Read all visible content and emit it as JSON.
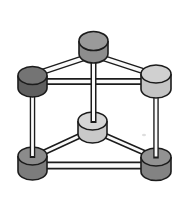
{
  "figure": {
    "canvas": {
      "width": 188,
      "height": 200,
      "background": "#ffffff"
    },
    "style": {
      "outline_color": "#1c1c1c",
      "outline_width": 1.6,
      "bar_fill": "#fafafa"
    },
    "nodes": [
      {
        "id": "top-center-cylinder",
        "cx": 93.5,
        "rx": 14.5,
        "ry": 9.5,
        "top_cy": 41,
        "bottom_cy": 53.5,
        "top_color": "#9a9a9a",
        "body_color": "#8d8d8d"
      },
      {
        "id": "top-left-cylinder",
        "cx": 32.5,
        "rx": 14.5,
        "ry": 9,
        "top_cy": 75.5,
        "bottom_cy": 88,
        "top_color": "#747474",
        "body_color": "#5f5f5f"
      },
      {
        "id": "top-right-cylinder",
        "cx": 156,
        "rx": 15,
        "ry": 9,
        "top_cy": 74,
        "bottom_cy": 89,
        "top_color": "#d0d0d0",
        "body_color": "#c4c4c4"
      },
      {
        "id": "middle-cylinder",
        "cx": 92.5,
        "rx": 14.5,
        "ry": 9,
        "top_cy": 121,
        "bottom_cy": 134,
        "top_color": "#d6d6d6",
        "body_color": "#c9c9c9"
      },
      {
        "id": "bottom-left-cylinder",
        "cx": 32.5,
        "rx": 14.5,
        "ry": 9,
        "top_cy": 156,
        "bottom_cy": 171,
        "top_color": "#8b8b8b",
        "body_color": "#7c7c7c"
      },
      {
        "id": "bottom-right-cylinder",
        "cx": 156,
        "rx": 15,
        "ry": 9,
        "top_cy": 157,
        "bottom_cy": 171.5,
        "top_color": "#929292",
        "body_color": "#838383"
      }
    ],
    "bars": [
      {
        "id": "bar-top-center-to-top-left",
        "x1": 90,
        "y1": 56,
        "x2": 36,
        "y2": 74,
        "outer": 6.5,
        "inner": 3.5
      },
      {
        "id": "bar-top-center-to-top-right",
        "x1": 97,
        "y1": 56,
        "x2": 152,
        "y2": 74,
        "outer": 6.5,
        "inner": 3.5
      },
      {
        "id": "bar-top-left-to-top-right",
        "x1": 34,
        "y1": 81.5,
        "x2": 155,
        "y2": 81.5,
        "outer": 7,
        "inner": 3.5
      },
      {
        "id": "bar-middle-to-bottom-left",
        "x1": 88,
        "y1": 132,
        "x2": 34,
        "y2": 157,
        "outer": 6,
        "inner": 3
      },
      {
        "id": "bar-middle-to-bottom-right",
        "x1": 97,
        "y1": 132,
        "x2": 154,
        "y2": 157,
        "outer": 6,
        "inner": 3
      },
      {
        "id": "bar-bottom-left-to-bottom-right",
        "x1": 34,
        "y1": 165.5,
        "x2": 155,
        "y2": 165.5,
        "outer": 8,
        "inner": 4.5
      },
      {
        "id": "bar-top-center-to-middle",
        "x1": 93.5,
        "y1": 50,
        "x2": 93.5,
        "y2": 123,
        "outer": 6,
        "inner": 3,
        "tip_inset": 2
      },
      {
        "id": "bar-top-left-to-bottom-left",
        "x1": 32.5,
        "y1": 85,
        "x2": 32.5,
        "y2": 158,
        "outer": 5.5,
        "inner": 2.8,
        "tip_inset": 2
      },
      {
        "id": "bar-top-right-to-bottom-right",
        "x1": 156,
        "y1": 86,
        "x2": 156,
        "y2": 158.5,
        "outer": 5.5,
        "inner": 2.8,
        "tip_inset": 2
      }
    ],
    "draw_order": [
      "bar:bar-top-center-to-top-left",
      "bar:bar-top-center-to-top-right",
      "bar:bar-top-left-to-top-right",
      "bar:bar-middle-to-bottom-left",
      "bar:bar-middle-to-bottom-right",
      "bar:bar-bottom-left-to-bottom-right",
      "node:middle-cylinder",
      "node:bottom-left-cylinder",
      "node:bottom-right-cylinder",
      "bar:bar-top-center-to-middle",
      "bar:bar-top-left-to-bottom-left",
      "bar:bar-top-right-to-bottom-right",
      "node:top-center-cylinder",
      "node:top-left-cylinder",
      "node:top-right-cylinder"
    ],
    "artifact": {
      "cx": 144,
      "cy": 135,
      "rx": 2,
      "ry": 1.3,
      "color": "#dedede"
    }
  }
}
